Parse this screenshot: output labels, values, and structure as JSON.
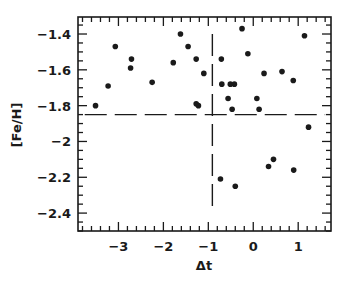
{
  "chart_data": {
    "type": "scatter",
    "title": "",
    "xlabel": "Δt",
    "ylabel": "[Fe/H]",
    "xlim": [
      -3.9,
      1.73
    ],
    "ylim": [
      -2.5,
      -1.305
    ],
    "grid": false,
    "legend": null,
    "x_ticks": [
      -3,
      -2,
      -1,
      0,
      1
    ],
    "x_tick_labels": [
      "-3",
      "-2",
      "-1",
      "0",
      "1"
    ],
    "x_minor_step": 0.2,
    "y_ticks": [
      -2.4,
      -2.2,
      -2.0,
      -1.8,
      -1.6,
      -1.4
    ],
    "y_tick_labels": [
      "-2.4",
      "-2.2",
      "-2",
      "-1.8",
      "-1.6",
      "-1.4"
    ],
    "y_minor_step": 0.05,
    "series": [
      {
        "name": "data",
        "marker": "filled-circle",
        "color": "#1a1a1a",
        "points": [
          {
            "x": -3.51,
            "y": -1.8
          },
          {
            "x": -3.23,
            "y": -1.69
          },
          {
            "x": -3.07,
            "y": -1.47
          },
          {
            "x": -2.71,
            "y": -1.54
          },
          {
            "x": -2.73,
            "y": -1.59
          },
          {
            "x": -2.25,
            "y": -1.67
          },
          {
            "x": -1.78,
            "y": -1.56
          },
          {
            "x": -1.62,
            "y": -1.4
          },
          {
            "x": -1.45,
            "y": -1.47
          },
          {
            "x": -1.27,
            "y": -1.54
          },
          {
            "x": -1.1,
            "y": -1.62
          },
          {
            "x": -1.27,
            "y": -1.79
          },
          {
            "x": -1.22,
            "y": -1.8
          },
          {
            "x": -0.71,
            "y": -1.54
          },
          {
            "x": -0.7,
            "y": -1.68
          },
          {
            "x": -0.51,
            "y": -1.68
          },
          {
            "x": -0.42,
            "y": -1.68
          },
          {
            "x": -0.56,
            "y": -1.76
          },
          {
            "x": -0.47,
            "y": -1.82
          },
          {
            "x": -0.25,
            "y": -1.37
          },
          {
            "x": -0.12,
            "y": -1.51
          },
          {
            "x": 0.08,
            "y": -1.76
          },
          {
            "x": 0.13,
            "y": -1.82
          },
          {
            "x": 0.24,
            "y": -1.62
          },
          {
            "x": 0.64,
            "y": -1.61
          },
          {
            "x": 0.89,
            "y": -1.66
          },
          {
            "x": 1.14,
            "y": -1.41
          },
          {
            "x": 1.23,
            "y": -1.92
          },
          {
            "x": -0.73,
            "y": -2.21
          },
          {
            "x": -0.4,
            "y": -2.25
          },
          {
            "x": 0.34,
            "y": -2.14
          },
          {
            "x": 0.45,
            "y": -2.1
          },
          {
            "x": 0.9,
            "y": -2.16
          }
        ]
      }
    ],
    "reference_lines": [
      {
        "orientation": "horizontal",
        "value": -1.85,
        "from": -3.75,
        "to": 1.6,
        "style": "long-dash"
      },
      {
        "orientation": "vertical",
        "value": -0.91,
        "from": -2.4,
        "to": -1.4,
        "style": "long-dash"
      }
    ]
  },
  "layout": {
    "frame": {
      "left": 78,
      "top": 17,
      "right": 331,
      "bottom": 231
    },
    "ink_color": "#1a1a1a"
  }
}
